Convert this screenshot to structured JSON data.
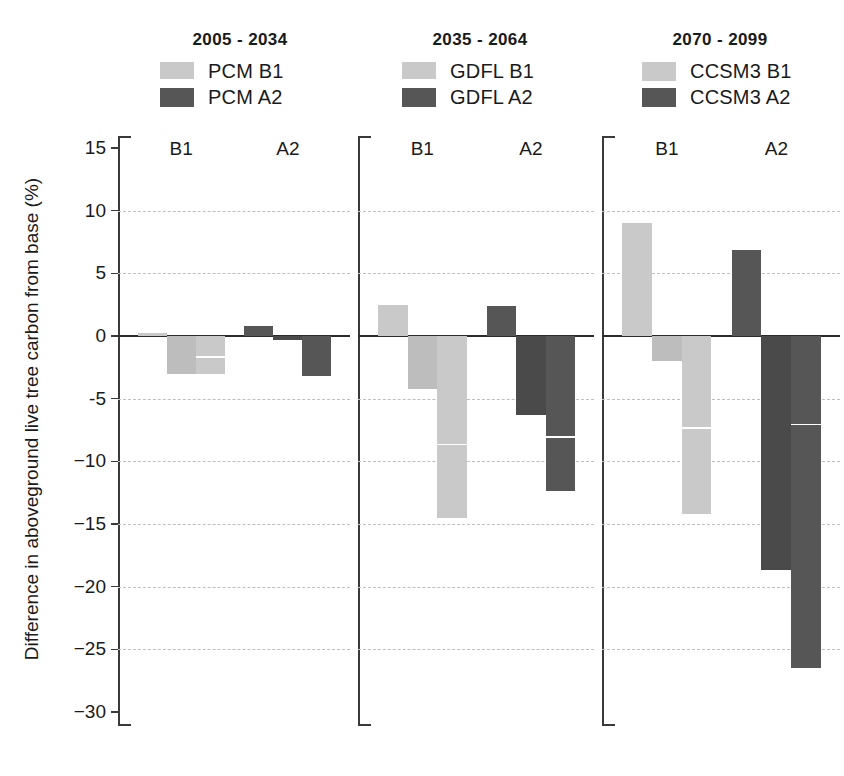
{
  "chart_data": {
    "type": "bar",
    "title": "",
    "xlabel": "",
    "ylabel": "Difference in aboveground live tree carbon from base (%)",
    "ylim": [
      -30,
      15
    ],
    "ytick_labels": [
      "15",
      "10",
      "5",
      "0",
      "-5",
      "−10",
      "−15",
      "−20",
      "−25",
      "−30"
    ],
    "ytick_values": [
      15,
      10,
      5,
      0,
      -5,
      -10,
      -15,
      -20,
      -25,
      -30
    ],
    "grid": "horizontal dashed gridlines at every 5 units",
    "legend_position": "top, one legend per panel",
    "colors": {
      "light": "#c9c9c9",
      "light_alt": "#bdbdbd",
      "dark": "#565656",
      "dark_alt": "#4a4a4a",
      "axis": "#3a3a3a",
      "grid": "#bfbfbf"
    },
    "panels": [
      {
        "title": "2005 - 2034",
        "model": "PCM",
        "legend": [
          {
            "label": "PCM  B1",
            "swatch": "light"
          },
          {
            "label": "PCM  A2",
            "swatch": "dark"
          }
        ],
        "groups": [
          {
            "label": "B1",
            "series": "PCM B1",
            "swatch": "light",
            "values": [
              0.2,
              -3.0,
              -3.0
            ],
            "split": [
              null,
              null,
              -1.6
            ]
          },
          {
            "label": "A2",
            "series": "PCM A2",
            "swatch": "dark",
            "values": [
              0.8,
              -0.3,
              -3.2
            ],
            "split": [
              null,
              null,
              null
            ]
          }
        ]
      },
      {
        "title": "2035 - 2064",
        "model": "GDFL",
        "legend": [
          {
            "label": "GDFL  B1",
            "swatch": "light"
          },
          {
            "label": "GDFL  A2",
            "swatch": "dark"
          }
        ],
        "groups": [
          {
            "label": "B1",
            "series": "GDFL B1",
            "swatch": "light",
            "values": [
              2.5,
              -4.2,
              -14.5
            ],
            "split": [
              null,
              null,
              -8.6
            ]
          },
          {
            "label": "A2",
            "series": "GDFL A2",
            "swatch": "dark",
            "values": [
              2.4,
              -6.3,
              -12.4
            ],
            "split": [
              null,
              null,
              -8.0
            ]
          }
        ]
      },
      {
        "title": "2070 - 2099",
        "model": "CCSM3",
        "legend": [
          {
            "label": "CCSM3  B1",
            "swatch": "light"
          },
          {
            "label": "CCSM3  A2",
            "swatch": "dark"
          }
        ],
        "groups": [
          {
            "label": "B1",
            "series": "CCSM3 B1",
            "swatch": "light",
            "values": [
              9.0,
              -2.0,
              -14.2
            ],
            "split": [
              null,
              null,
              -7.3
            ]
          },
          {
            "label": "A2",
            "series": "CCSM3 A2",
            "swatch": "dark",
            "values": [
              6.9,
              -18.7,
              -26.5
            ],
            "split": [
              null,
              null,
              -7.0
            ]
          }
        ]
      }
    ]
  }
}
